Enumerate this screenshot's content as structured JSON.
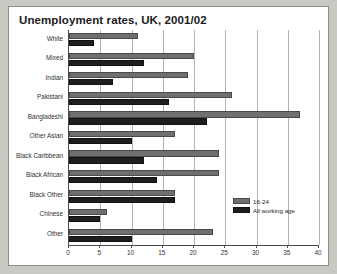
{
  "chart_data": {
    "type": "bar",
    "orientation": "horizontal",
    "title": "Unemployment rates, UK, 2001/02",
    "xlabel": "",
    "ylabel": "",
    "xlim": [
      0,
      40
    ],
    "xticks": [
      0,
      5,
      10,
      15,
      20,
      25,
      30,
      35,
      40
    ],
    "grid": true,
    "legend_position": "bottom-right",
    "categories": [
      "White",
      "Mixed",
      "Indian",
      "Pakistani",
      "Bangladeshi",
      "Other Asian",
      "Black Caribbean",
      "Black African",
      "Black Other",
      "Chinese",
      "Other"
    ],
    "series": [
      {
        "name": "16-24",
        "color": "#6f6f6f",
        "values": [
          11,
          20,
          19,
          26,
          37,
          17,
          24,
          24,
          17,
          6,
          23
        ]
      },
      {
        "name": "All working age",
        "color": "#1e1e1e",
        "values": [
          4,
          12,
          7,
          16,
          22,
          10,
          12,
          14,
          17,
          5,
          10
        ]
      }
    ]
  },
  "legend": {
    "items": [
      {
        "label": "16-24"
      },
      {
        "label": "All working age"
      }
    ]
  }
}
